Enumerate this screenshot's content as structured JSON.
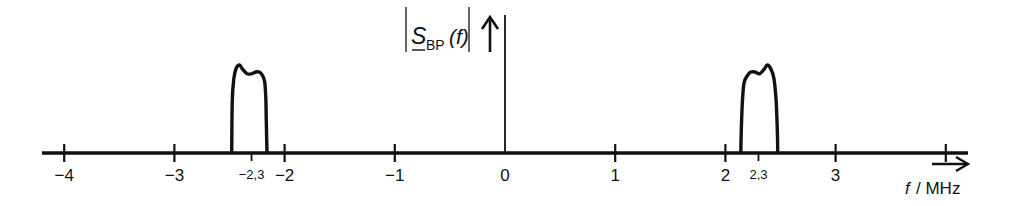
{
  "chart_data": {
    "type": "line",
    "title": "",
    "ylabel": {
      "symbol": "S",
      "subscript": "BP",
      "argument": "(f)",
      "full": "|S_BP(f)|"
    },
    "xlabel": {
      "variable": "f",
      "unit": "/ MHz",
      "full": "f / MHz"
    },
    "xlim": [
      -4.4,
      4.2
    ],
    "ylim": [
      0,
      1.1
    ],
    "grid": false,
    "x_ticks": [
      {
        "value": -4,
        "label": "−4"
      },
      {
        "value": -3,
        "label": "−3"
      },
      {
        "value": -2,
        "label": "−2"
      },
      {
        "value": -1,
        "label": "−1"
      },
      {
        "value": 0,
        "label": "0"
      },
      {
        "value": 1,
        "label": "1"
      },
      {
        "value": 2,
        "label": "2"
      },
      {
        "value": 3,
        "label": "3"
      },
      {
        "value": 4,
        "label": ""
      }
    ],
    "minor_ticks": [
      {
        "value": -2.3,
        "label": "−2,3"
      },
      {
        "value": 2.3,
        "label": "2,3"
      }
    ],
    "series": [
      {
        "name": "negative-frequency band",
        "x": [
          -2.48,
          -2.475,
          -2.46,
          -2.44,
          -2.41,
          -2.38,
          -2.34,
          -2.3,
          -2.26,
          -2.23,
          -2.2,
          -2.18,
          -2.17,
          -2.165,
          -2.16
        ],
        "y": [
          0,
          0.6,
          0.85,
          0.96,
          1.0,
          0.95,
          0.9,
          0.9,
          0.92,
          0.92,
          0.88,
          0.8,
          0.6,
          0.3,
          0
        ]
      },
      {
        "name": "positive-frequency band",
        "x": [
          2.14,
          2.145,
          2.155,
          2.17,
          2.2,
          2.23,
          2.27,
          2.31,
          2.35,
          2.38,
          2.41,
          2.44,
          2.46,
          2.47,
          2.475
        ],
        "y": [
          0,
          0.3,
          0.6,
          0.8,
          0.88,
          0.92,
          0.92,
          0.9,
          0.95,
          1.0,
          0.96,
          0.85,
          0.6,
          0.3,
          0
        ]
      }
    ]
  }
}
